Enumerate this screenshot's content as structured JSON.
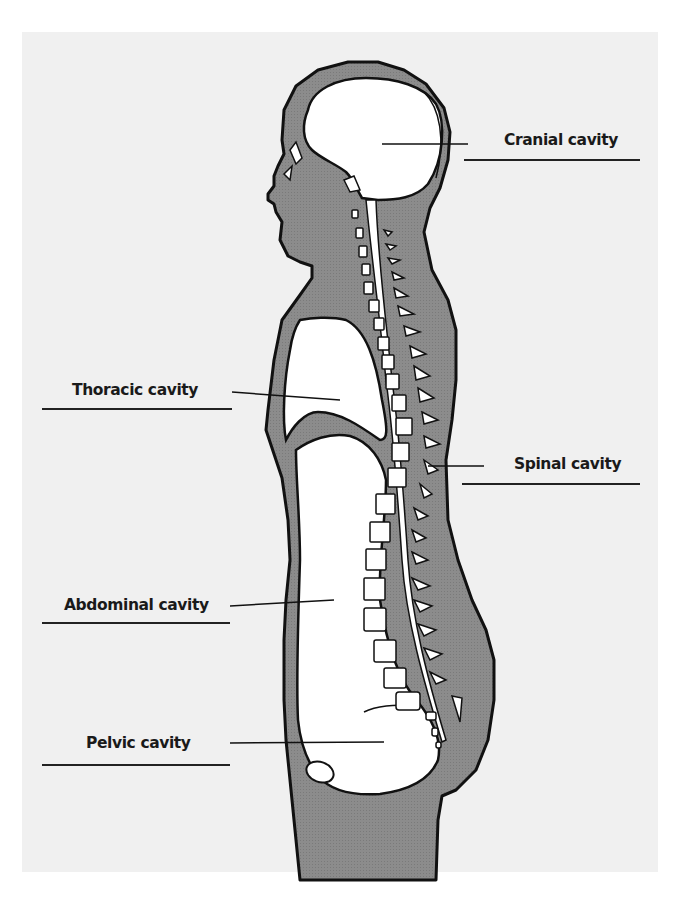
{
  "diagram": {
    "colors": {
      "background": "#ffffff",
      "panel": "#f0f0f0",
      "body_fill": "#8a8a8a",
      "cavity_fill": "#ffffff",
      "outline": "#111111"
    },
    "labels": [
      {
        "id": "cranial",
        "text": "Cranial cavity"
      },
      {
        "id": "thoracic",
        "text": "Thoracic cavity"
      },
      {
        "id": "spinal",
        "text": "Spinal cavity"
      },
      {
        "id": "abdominal",
        "text": "Abdominal cavity"
      },
      {
        "id": "pelvic",
        "text": "Pelvic cavity"
      }
    ]
  }
}
